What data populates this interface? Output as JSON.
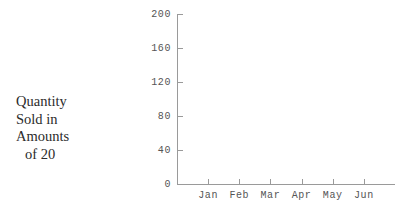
{
  "figure": {
    "background": "#ffffff",
    "axis_color": "#9a9a9a",
    "tick_label_color": "#555555",
    "caption_color": "#2b2b2b"
  },
  "caption": {
    "line1": "Quantity",
    "line2": "Sold in",
    "line3": "Amounts",
    "line4": "of 20"
  },
  "chart_data": {
    "type": "bar",
    "title": "",
    "xlabel": "",
    "ylabel": "Quantity Sold in Amounts of 20",
    "categories": [
      "Jan",
      "Feb",
      "Mar",
      "Apr",
      "May",
      "Jun"
    ],
    "values": [
      null,
      null,
      null,
      null,
      null,
      null
    ],
    "series": [],
    "ylim": [
      0,
      200
    ],
    "yticks": [
      0,
      40,
      80,
      120,
      160,
      200
    ],
    "ytick_labels": [
      "0",
      "40",
      "80",
      "120",
      "160",
      "200"
    ],
    "xtick_labels": [
      "Jan",
      "Feb",
      "Mar",
      "Apr",
      "May",
      "Jun"
    ],
    "grid": false,
    "legend": false,
    "legend_position": "none",
    "note": "plot area is empty; no data series are drawn"
  }
}
